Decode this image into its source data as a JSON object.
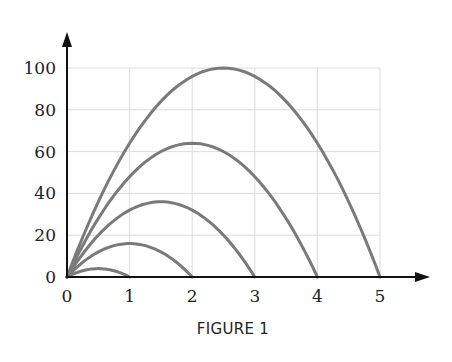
{
  "figure": {
    "caption": "FIGURE 1"
  },
  "colors": {
    "curve": "#7a7a7a",
    "grid": "#dcdcdc",
    "axis": "#111111"
  },
  "chart_data": {
    "type": "line",
    "title": "",
    "caption": "FIGURE 1",
    "xlabel": "",
    "ylabel": "",
    "xlim": [
      0,
      5
    ],
    "ylim": [
      0,
      100
    ],
    "xticks": [
      0,
      1,
      2,
      3,
      4,
      5
    ],
    "yticks": [
      0,
      20,
      40,
      60,
      80,
      100
    ],
    "grid": true,
    "legend": null,
    "series": [
      {
        "name": "n=1",
        "x": [
          0,
          0.25,
          0.5,
          0.75,
          1
        ],
        "values": [
          0,
          3,
          4,
          3,
          0
        ]
      },
      {
        "name": "n=2",
        "x": [
          0,
          0.5,
          1,
          1.5,
          2
        ],
        "values": [
          0,
          12,
          16,
          12,
          0
        ]
      },
      {
        "name": "n=3",
        "x": [
          0,
          0.75,
          1.5,
          2.25,
          3
        ],
        "values": [
          0,
          27,
          36,
          27,
          0
        ]
      },
      {
        "name": "n=4",
        "x": [
          0,
          1,
          2,
          3,
          4
        ],
        "values": [
          0,
          48,
          64,
          48,
          0
        ]
      },
      {
        "name": "n=5",
        "x": [
          0,
          1.25,
          2.5,
          3.75,
          5
        ],
        "values": [
          0,
          75,
          100,
          75,
          0
        ]
      }
    ]
  }
}
